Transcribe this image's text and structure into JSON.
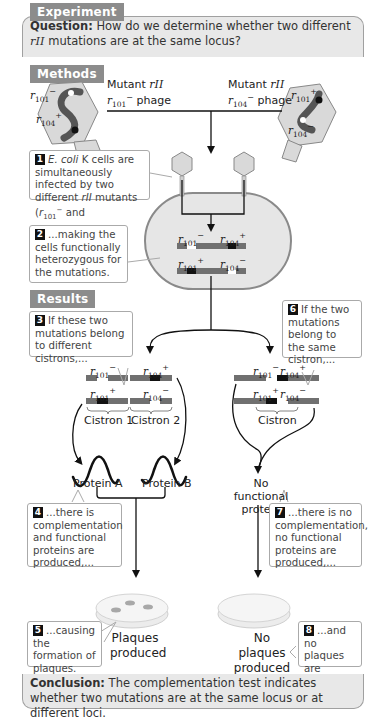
{
  "headers": {
    "experiment": "Experiment",
    "methods": "Methods",
    "results": "Results"
  },
  "question": {
    "label": "Question:",
    "text_before": " How do we determine whether two different ",
    "italic": "rII",
    "text_after": " mutations are at the same locus?"
  },
  "phages": {
    "left": {
      "title_line1": "Mutant ",
      "title_italic": "rII",
      "title_line2_prefix": "r",
      "title_line2_sub": "101",
      "title_line2_sup": "−",
      "title_line2_suffix": " phage",
      "top_label": {
        "r": "r",
        "sub": "101",
        "sup": "−"
      },
      "bottom_label": {
        "r": "r",
        "sub": "104",
        "sup": "+"
      }
    },
    "right": {
      "title_line1": "Mutant ",
      "title_italic": "rII",
      "title_line2_prefix": "r",
      "title_line2_sub": "104",
      "title_line2_sup": "−",
      "title_line2_suffix": " phage",
      "top_label": {
        "r": "r",
        "sub": "101",
        "sup": "+"
      },
      "bottom_label": {
        "r": "r",
        "sub": "104",
        "sup": "−"
      }
    }
  },
  "steps": [
    {
      "num": "1",
      "text": "E. coli K cells are simultaneously infected by two different rII mutants (r101− and"
    },
    {
      "num": "2",
      "text": "...making the cells functionally heterozygous for the mutations."
    },
    {
      "num": "3",
      "text": "If these two mutations belong to different cistrons,..."
    },
    {
      "num": "4",
      "text": "...there is complementation and functional proteins are produced,..."
    },
    {
      "num": "5",
      "text": "...causing the formation of plaques."
    },
    {
      "num": "6",
      "text": "If the two mutations belong to the same cistron,..."
    },
    {
      "num": "7",
      "text": "...there is no complementation, no functional proteins are produced,..."
    },
    {
      "num": "8",
      "text": "...and no plaques are formed."
    }
  ],
  "step1_parts": {
    "italic1": "E. coli",
    "text1": " K cells are simultaneously infected by two different ",
    "italic2": "rII",
    "text2": " mutants (",
    "r": "r",
    "sub": "101",
    "sup": "−",
    "text3": " and"
  },
  "cell": {
    "row1": [
      {
        "r": "r",
        "sub": "101",
        "sup": "−"
      },
      {
        "r": "r",
        "sub": "104",
        "sup": "+"
      }
    ],
    "row2": [
      {
        "r": "r",
        "sub": "101",
        "sup": "+"
      },
      {
        "r": "r",
        "sub": "104",
        "sup": "−"
      }
    ]
  },
  "left_result": {
    "row1": [
      {
        "r": "r",
        "sub": "101",
        "sup": "−"
      },
      {
        "r": "r",
        "sub": "104",
        "sup": "+"
      }
    ],
    "row2": [
      {
        "r": "r",
        "sub": "101",
        "sup": "+"
      },
      {
        "r": "r",
        "sub": "104",
        "sup": "−"
      }
    ],
    "cistron1": "Cistron 1",
    "cistron2": "Cistron 2",
    "protein_a": "Protein A",
    "protein_b": "Protein B",
    "outcome_line1": "Plaques",
    "outcome_line2": "produced"
  },
  "right_result": {
    "row1": [
      {
        "r": "r",
        "sub": "101",
        "sup": "−"
      },
      {
        "r": "r",
        "sub": "104",
        "sup": "+"
      }
    ],
    "row2": [
      {
        "r": "r",
        "sub": "101",
        "sup": "+"
      },
      {
        "r": "r",
        "sub": "104",
        "sup": "−"
      }
    ],
    "cistron": "Cistron",
    "protein_line1": "No functional",
    "protein_line2": "protein",
    "outcome_line1": "No plaques",
    "outcome_line2": "produced"
  },
  "conclusion": {
    "label": "Conclusion:",
    "text": " The complementation test indicates whether two mutations are at the same locus or at different loci."
  },
  "colors": {
    "header_gray": "#8c8c8c",
    "panel_gray": "#e8e8e8",
    "chromosome": "#707070",
    "mutant_white": "#ffffff",
    "wildtype_black": "#111111",
    "cell_fill": "#e6e6e6"
  }
}
